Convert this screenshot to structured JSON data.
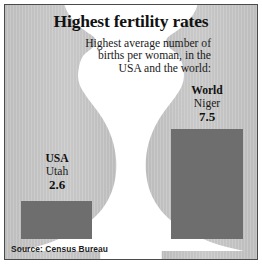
{
  "chart_data": {
    "type": "bar",
    "title": "Highest fertility rates",
    "subtitle_lines": [
      "Highest average number of",
      "births per woman, in the",
      "USA and the world:"
    ],
    "xlabel": "",
    "ylabel": "Births per woman",
    "ylim": [
      0,
      7.5
    ],
    "grid": false,
    "legend": "none",
    "categories": [
      "USA",
      "World"
    ],
    "values": [
      2.6,
      7.5
    ],
    "points": [
      {
        "category": "USA",
        "region_label": "USA",
        "place_label": "Utah",
        "value": 2.6,
        "value_label": "2.6",
        "bar_color": "#6e6e6e"
      },
      {
        "category": "World",
        "region_label": "World",
        "place_label": "Niger",
        "value": 7.5,
        "value_label": "7.5",
        "bar_color": "#6e6e6e"
      }
    ],
    "source": "Source: Census Bureau",
    "annotations": [
      "Background illustration: two mirrored pregnant-woman silhouettes facing away from each other"
    ]
  },
  "colors": {
    "bar_fill": "#6e6e6e",
    "silhouette": "#c3c3c3",
    "silhouette_shade": "#b4b4b4",
    "background": "#ffffff",
    "frame_border": "#4a4a4a",
    "text": "#111111"
  },
  "icons": {
    "silhouette_left": "pregnant-woman-silhouette-left",
    "silhouette_right": "pregnant-woman-silhouette-right"
  }
}
